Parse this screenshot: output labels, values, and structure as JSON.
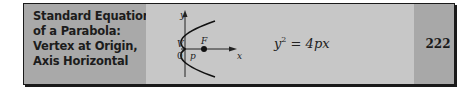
{
  "entry": {
    "title_lines": [
      "Standard Equation",
      "of a Parabola:",
      "Vertex at Origin,",
      "Axis Horizontal"
    ],
    "figure": {
      "icon": "parabola-diagram-icon",
      "labels": {
        "y_axis": "y",
        "x_axis": "x",
        "vertex": "V",
        "focus": "F",
        "origin": "0",
        "distance": "p"
      }
    },
    "equation": {
      "base": "y",
      "exponent": "2",
      "rest": " = 4px"
    },
    "page_number": "222"
  },
  "colors": {
    "label_panel": "#a9a9a9",
    "figure_panel": "#c7c7c7",
    "number_panel": "#a8a8a8",
    "border": "#1a1a1a"
  }
}
